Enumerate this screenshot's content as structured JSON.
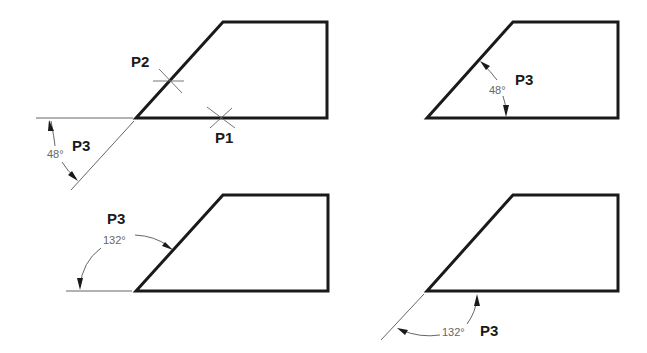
{
  "diagram": {
    "type": "drafting-angle-dimension",
    "colors": {
      "object_line": "#1a1a1a",
      "dimension_line": "#555555",
      "dimension_text": "#666666"
    },
    "panels": [
      {
        "id": "top-left",
        "labels": {
          "p1": "P1",
          "p2": "P2",
          "p3": "P3"
        },
        "angle": "48°"
      },
      {
        "id": "top-right",
        "labels": {
          "p3": "P3"
        },
        "angle": "48°"
      },
      {
        "id": "bottom-left",
        "labels": {
          "p3": "P3"
        },
        "angle": "132°"
      },
      {
        "id": "bottom-right",
        "labels": {
          "p3": "P3"
        },
        "angle": "132°"
      }
    ]
  }
}
